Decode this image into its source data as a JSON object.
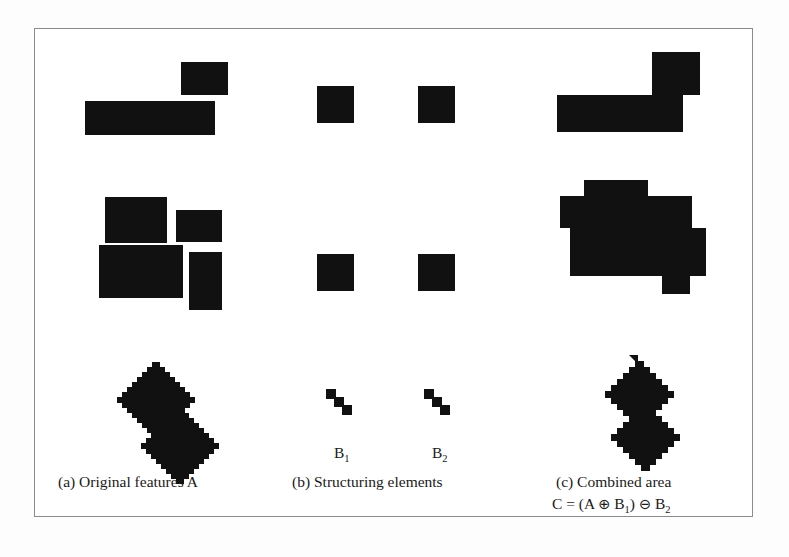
{
  "figure": {
    "background_color": "#ffffff",
    "shape_color": "#111111",
    "border_color": "#8b8b8b"
  },
  "panels": {
    "a": {
      "caption": "(a) Original features A",
      "shapes": {
        "top_rect_small": {
          "x": 181,
          "y": 62,
          "w": 47,
          "h": 33
        },
        "top_rect_wide": {
          "x": 85,
          "y": 101,
          "w": 130,
          "h": 34
        },
        "mid_rect_1": {
          "x": 105,
          "y": 197,
          "w": 62,
          "h": 46
        },
        "mid_rect_2": {
          "x": 176,
          "y": 210,
          "w": 46,
          "h": 32
        },
        "mid_rect_3": {
          "x": 99,
          "y": 245,
          "w": 84,
          "h": 53
        },
        "mid_rect_4": {
          "x": 189,
          "y": 252,
          "w": 33,
          "h": 58
        },
        "diamond_upper": "rotated pixelated rectangle",
        "diamond_lower": "rotated pixelated rectangle"
      }
    },
    "b": {
      "caption": "(b) Structuring elements",
      "label_b1": "B",
      "label_b1_sub": "1",
      "label_b2": "B",
      "label_b2_sub": "2",
      "shapes": {
        "sq_top_left": {
          "x": 317,
          "y": 86,
          "w": 37,
          "h": 37
        },
        "sq_top_right": {
          "x": 418,
          "y": 86,
          "w": 37,
          "h": 37
        },
        "sq_mid_left": {
          "x": 317,
          "y": 254,
          "w": 37,
          "h": 37
        },
        "sq_mid_right": {
          "x": 418,
          "y": 254,
          "w": 37,
          "h": 37
        },
        "diag_left": "three-cell diagonal staircase",
        "diag_right": "three-cell diagonal staircase"
      }
    },
    "c": {
      "caption_line1": "(c) Combined area",
      "caption_line2_prefix": "C = (A ",
      "caption_dilate_symbol": "⊕",
      "caption_line2_mid": " B",
      "caption_b1_sub": "1",
      "caption_line2_close": ") ",
      "caption_erode_symbol": "⊖",
      "caption_line2_end": " B",
      "caption_b2_sub": "2",
      "shapes": {
        "top_L_shape": "L-shaped merged region",
        "mid_blob": "stepped merged blob",
        "bottom_s_shape": "pixelated S-shaped merged region"
      }
    }
  },
  "symbols": {
    "dilation": "⊕",
    "erosion": "⊖"
  }
}
